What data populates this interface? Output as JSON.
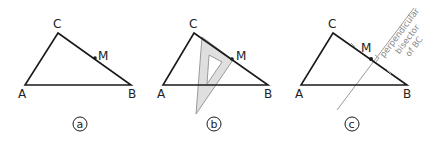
{
  "figures": [
    {
      "id": "a",
      "caption": "a",
      "vertices": {
        "A": "A",
        "B": "B",
        "C": "C"
      },
      "midpoint": "M",
      "description": "Triangle ABC with midpoint M on side BC"
    },
    {
      "id": "b",
      "caption": "b",
      "vertices": {
        "A": "A",
        "B": "B",
        "C": "C"
      },
      "midpoint": "M",
      "description": "Set square placed at M perpendicular to BC"
    },
    {
      "id": "c",
      "caption": "c",
      "vertices": {
        "A": "A",
        "B": "B",
        "C": "C"
      },
      "midpoint": "M",
      "description": "Perpendicular bisector of BC drawn through M",
      "line_label": [
        "perpendicular",
        "bisector",
        "of BC"
      ]
    }
  ],
  "colors": {
    "stroke": "#1a1a1a",
    "set_square_fill": "#d9d9d9",
    "set_square_stroke": "#9a9a9a",
    "bisector": "#9a9a9a"
  }
}
